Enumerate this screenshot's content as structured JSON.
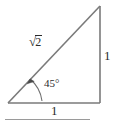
{
  "figure": {
    "name": "right-triangle-45-45-90",
    "stroke_color": "#7a7a7a",
    "text_color": "#2b2b2b",
    "rule_color": "#9a9a9a",
    "background": "#ffffff",
    "vertices": {
      "left": [
        8,
        103
      ],
      "bottom_right": [
        100,
        103
      ],
      "top_right": [
        100,
        6
      ]
    },
    "labels": {
      "hypotenuse_sign": "√",
      "hypotenuse_radicand": "2",
      "hypotenuse_full": "√2",
      "leg_vertical": "1",
      "leg_base": "1",
      "angle": "45°"
    },
    "angle_arc": {
      "degrees": 45,
      "has_arrowhead": true,
      "arrow_target": "hypotenuse"
    },
    "bottom_rule": {
      "x": 5,
      "y": 119,
      "width": 85
    }
  }
}
